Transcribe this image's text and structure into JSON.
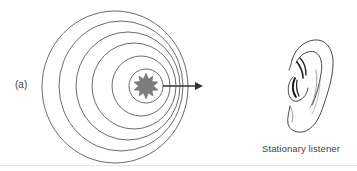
{
  "figure": {
    "panel_label": "(a)",
    "caption": "Stationary listener",
    "source": {
      "icon": "sound-source-star-icon",
      "color": "#7a7a7a",
      "center": [
        146,
        86
      ]
    },
    "wavefronts": [
      {
        "cx": 146,
        "cy": 86,
        "rx": 17,
        "ry": 17
      },
      {
        "cx": 141,
        "cy": 86,
        "rx": 29,
        "ry": 30
      },
      {
        "cx": 134,
        "cy": 86,
        "rx": 42,
        "ry": 43
      },
      {
        "cx": 128,
        "cy": 86,
        "rx": 52,
        "ry": 54
      },
      {
        "cx": 121,
        "cy": 86,
        "rx": 62,
        "ry": 65
      },
      {
        "cx": 115,
        "cy": 87,
        "rx": 73,
        "ry": 76
      }
    ],
    "arrow": {
      "from": [
        163,
        86
      ],
      "to": [
        203,
        86
      ],
      "color": "#333333"
    },
    "listener_icon": "ear-icon",
    "line_color": "#555555"
  }
}
